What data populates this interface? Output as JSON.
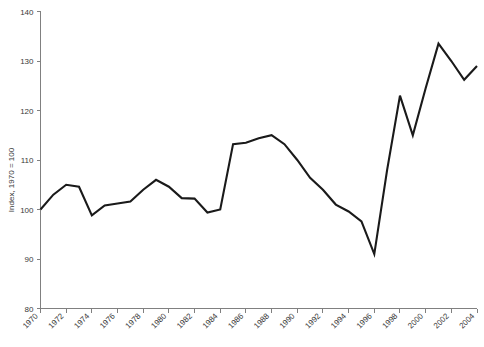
{
  "chart_data": {
    "type": "line",
    "title": "",
    "subtitle": "",
    "xlabel": "",
    "ylabel": "Index, 1970 = 100",
    "xlim": [
      1970,
      2004
    ],
    "ylim": [
      80,
      140
    ],
    "grid": false,
    "legend": false,
    "legend_position": "none",
    "line_color": "#1a1a1a",
    "axis_color": "#808080",
    "background_color": "#ffffff",
    "x_tick_labels": [
      "1970",
      "1972",
      "1974",
      "1976",
      "1978",
      "1980",
      "1982",
      "1984",
      "1986",
      "1988",
      "1990",
      "1992",
      "1994",
      "1996",
      "1998",
      "2000",
      "2002",
      "2004"
    ],
    "x_tick_values": [
      1970,
      1972,
      1974,
      1976,
      1978,
      1980,
      1982,
      1984,
      1986,
      1988,
      1990,
      1992,
      1994,
      1996,
      1998,
      2000,
      2002,
      2004
    ],
    "y_tick_labels": [
      "80",
      "90",
      "100",
      "110",
      "120",
      "130",
      "140"
    ],
    "y_tick_values": [
      80,
      90,
      100,
      110,
      120,
      130,
      140
    ],
    "x": [
      1970,
      1971,
      1972,
      1973,
      1974,
      1975,
      1976,
      1977,
      1978,
      1979,
      1980,
      1981,
      1982,
      1983,
      1984,
      1985,
      1986,
      1987,
      1988,
      1989,
      1990,
      1991,
      1992,
      1993,
      1994,
      1995,
      1996,
      1997,
      1998,
      1999,
      2000,
      2001,
      2002,
      2003,
      2004
    ],
    "values": [
      100.0,
      103.0,
      105.0,
      104.6,
      98.8,
      100.8,
      101.2,
      101.6,
      104.0,
      106.0,
      104.6,
      102.3,
      102.2,
      99.4,
      100.0,
      113.2,
      113.5,
      114.4,
      115.0,
      113.2,
      110.0,
      106.4,
      104.0,
      101.0,
      99.6,
      97.6,
      91.0,
      108.0,
      123.0,
      115.0,
      124.5,
      133.5,
      130.0,
      126.2,
      129.0
    ],
    "series": [
      {
        "name": "Index",
        "values": [
          100.0,
          103.0,
          105.0,
          104.6,
          98.8,
          100.8,
          101.2,
          101.6,
          104.0,
          106.0,
          104.6,
          102.3,
          102.2,
          99.4,
          100.0,
          113.2,
          113.5,
          114.4,
          115.0,
          113.2,
          110.0,
          106.4,
          104.0,
          101.0,
          99.6,
          97.6,
          91.0,
          108.0,
          123.0,
          115.0,
          124.5,
          133.5,
          130.0,
          126.2,
          129.0
        ]
      }
    ],
    "annotations": []
  }
}
